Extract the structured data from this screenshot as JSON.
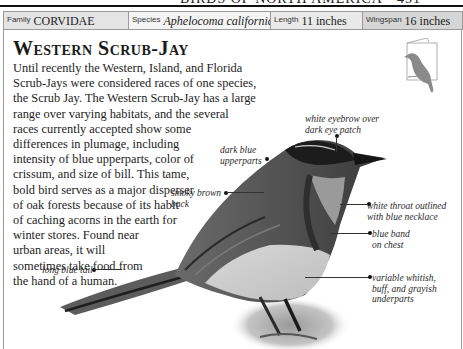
{
  "running_head": "BIRDS OF NORTH AMERICA • 451",
  "info_bar": {
    "family": {
      "label": "Family",
      "value": "CORVIDAE"
    },
    "species": {
      "label": "Species",
      "value": "Aphelocoma californica"
    },
    "length": {
      "label": "Length",
      "value": "11 inches"
    },
    "wingspan": {
      "label": "Wingspan",
      "value": "16 inches"
    }
  },
  "title": "Western Scrub-Jay",
  "body_lines": [
    "Until recently the Western, Island, and Florida",
    "Scrub-Jays were considered races of one species,",
    "the Scrub Jay. The Western Scrub-Jay has a large",
    "range over varying habitats, and the several",
    "races currently accepted show some",
    "differences in plumage, including",
    "intensity of blue upperparts, color of",
    "crissum, and size of bill. This tame,",
    "bold bird serves as a major disperser",
    "of oak forests because of its habit",
    "of caching acorns in the earth for",
    "winter stores. Found near",
    "urban areas, it will",
    "sometimes take food from",
    "the hand of a human."
  ],
  "annotations": {
    "eyebrow": [
      "white eyebrow over",
      "dark eye patch"
    ],
    "upperparts": [
      "dark blue",
      "upperparts"
    ],
    "back": [
      "smoky brown",
      "back"
    ],
    "throat": [
      "white throat outlined",
      "with blue necklace"
    ],
    "chest": [
      "blue band",
      "on chest"
    ],
    "underparts": [
      "variable whitish,",
      "buff, and grayish",
      "underparts"
    ],
    "tail": [
      "long blue tail"
    ]
  },
  "icons": {
    "silhouette": "perched-bird-silhouette-icon",
    "photo": "western-scrub-jay-photo"
  },
  "colors": {
    "rule": "#111111",
    "cell_border": "#9a9a9a",
    "family_bg": "#e4e4e4",
    "species_bg": "#f4f4f4",
    "length_bg": "#e9e9e9",
    "wingspan_bg": "#d6d6d6",
    "silhouette": "#8a8a8a"
  }
}
